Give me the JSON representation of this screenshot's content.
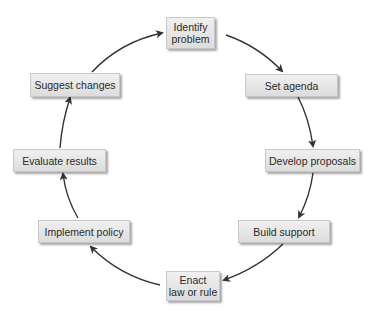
{
  "diagram": {
    "type": "cycle",
    "steps": [
      {
        "id": "identify",
        "line1": "Identify",
        "line2": "problem"
      },
      {
        "id": "agenda",
        "line1": "Set agenda"
      },
      {
        "id": "develop",
        "line1": "Develop proposals"
      },
      {
        "id": "support",
        "line1": "Build support"
      },
      {
        "id": "enact",
        "line1": "Enact",
        "line2": "law or rule"
      },
      {
        "id": "implement",
        "line1": "Implement policy"
      },
      {
        "id": "evaluate",
        "line1": "Evaluate results"
      },
      {
        "id": "suggest",
        "line1": "Suggest changes"
      }
    ],
    "colors": {
      "arrow": "#333333",
      "box_fill": "#e6e6e6",
      "text": "#2a2a2a"
    }
  }
}
